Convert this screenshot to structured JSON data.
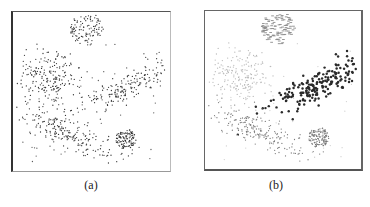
{
  "figure": {
    "captions": {
      "a": "(a)",
      "b": "(b)"
    }
  },
  "chart_data": [
    {
      "type": "scatter",
      "panel": "a",
      "title": "",
      "xlabel": "",
      "ylabel": "",
      "grid": false,
      "legend": null,
      "description": "Unlabeled 2D point cloud with five clusters (two round dense, three elongated/diffuse) plus sparse noise",
      "clusters": [
        {
          "name": "top-circle",
          "shape": "disc",
          "cx": 0.47,
          "cy": 0.1,
          "r": 0.11,
          "n": 120,
          "color": "#333333"
        },
        {
          "name": "left-diffuse",
          "shape": "gaussian",
          "cx": 0.22,
          "cy": 0.42,
          "sx": 0.09,
          "sy": 0.09,
          "rot": -20,
          "n": 200,
          "color": "#333333"
        },
        {
          "name": "right-elongated",
          "shape": "gaussian",
          "cx": 0.72,
          "cy": 0.47,
          "sx": 0.16,
          "sy": 0.04,
          "rot": -28,
          "n": 180,
          "color": "#333333"
        },
        {
          "name": "bottom-elongated",
          "shape": "gaussian",
          "cx": 0.36,
          "cy": 0.76,
          "sx": 0.17,
          "sy": 0.045,
          "rot": 24,
          "n": 200,
          "color": "#333333"
        },
        {
          "name": "bottom-right-circle",
          "shape": "disc",
          "cx": 0.72,
          "cy": 0.8,
          "r": 0.065,
          "n": 110,
          "color": "#333333"
        },
        {
          "name": "noise",
          "shape": "uniform",
          "n": 60,
          "color": "#555555"
        }
      ]
    },
    {
      "type": "scatter",
      "panel": "b",
      "title": "",
      "xlabel": "",
      "ylabel": "",
      "grid": false,
      "legend": null,
      "description": "Same data colored by cluster assignment; the right elongated cluster is highlighted in dark large markers",
      "clusters": [
        {
          "name": "top-circle",
          "shape": "disc",
          "cx": 0.47,
          "cy": 0.1,
          "r": 0.11,
          "n": 120,
          "color": "#8a8a8a",
          "marker": "dash"
        },
        {
          "name": "left-diffuse",
          "shape": "gaussian",
          "cx": 0.22,
          "cy": 0.42,
          "sx": 0.09,
          "sy": 0.09,
          "rot": -20,
          "n": 200,
          "color": "#b8b8b8",
          "marker": "dot"
        },
        {
          "name": "right-elongated",
          "shape": "gaussian",
          "cx": 0.72,
          "cy": 0.47,
          "sx": 0.16,
          "sy": 0.045,
          "rot": -28,
          "n": 200,
          "color": "#2a2a2a",
          "marker": "big-dot"
        },
        {
          "name": "bottom-elongated",
          "shape": "gaussian",
          "cx": 0.36,
          "cy": 0.76,
          "sx": 0.17,
          "sy": 0.045,
          "rot": 24,
          "n": 200,
          "color": "#7a7a7a",
          "marker": "dot"
        },
        {
          "name": "bottom-right-circle",
          "shape": "disc",
          "cx": 0.73,
          "cy": 0.8,
          "r": 0.065,
          "n": 130,
          "color": "#777777",
          "marker": "dot"
        },
        {
          "name": "noise",
          "shape": "uniform",
          "n": 30,
          "color": "#cfcfcf",
          "marker": "dot"
        }
      ]
    }
  ]
}
